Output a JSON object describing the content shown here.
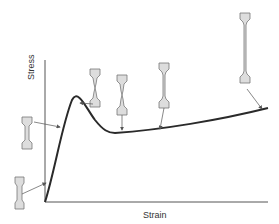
{
  "diagram": {
    "axes": {
      "x_label": "Strain",
      "y_label": "Stress"
    },
    "colors": {
      "curve": "#2a2a2a",
      "axis": "#555555",
      "specimen_fill": "#dddddd",
      "specimen_stroke": "#777777",
      "pointer": "#555555"
    },
    "curve": {
      "description": "Elastic rise, upper yield peak, drop to lower yield, then gradual strain hardening",
      "points": [
        [
          45,
          202
        ],
        [
          60,
          155
        ],
        [
          72,
          100
        ],
        [
          85,
          110
        ],
        [
          113,
          133
        ],
        [
          170,
          128
        ],
        [
          268,
          108
        ]
      ]
    },
    "specimens": [
      {
        "id": "stage-1",
        "label": "Initial elastic",
        "neck": "none"
      },
      {
        "id": "stage-2",
        "label": "Approaching yield",
        "neck": "none"
      },
      {
        "id": "stage-3",
        "label": "Upper yield point",
        "neck": "slight"
      },
      {
        "id": "stage-4",
        "label": "Lower yield / Luders band",
        "neck": "localized"
      },
      {
        "id": "stage-5",
        "label": "Strain hardening",
        "neck": "uniform elongation"
      },
      {
        "id": "stage-6",
        "label": "Large strain",
        "neck": "long gauge"
      }
    ]
  }
}
